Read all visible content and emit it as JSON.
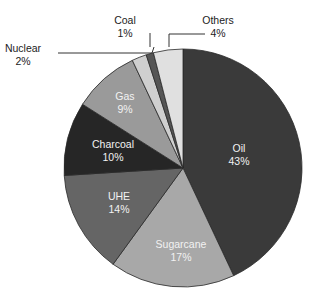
{
  "chart_data": {
    "type": "pie",
    "title": "",
    "start_angle": "12 o'clock, clockwise",
    "categories": [
      "Oil",
      "Sugarcane",
      "UHE",
      "Charcoal",
      "Gas",
      "Nuclear",
      "Coal",
      "Others"
    ],
    "values": [
      43,
      17,
      14,
      10,
      9,
      2,
      1,
      4
    ],
    "labels": [
      "43%",
      "17%",
      "14%",
      "10%",
      "9%",
      "2%",
      "1%",
      "4%"
    ],
    "colors": [
      "#3a3a3a",
      "#a8a8a8",
      "#656565",
      "#262626",
      "#9a9a9a",
      "#cfcfcf",
      "#555555",
      "#e0e0e0"
    ]
  }
}
